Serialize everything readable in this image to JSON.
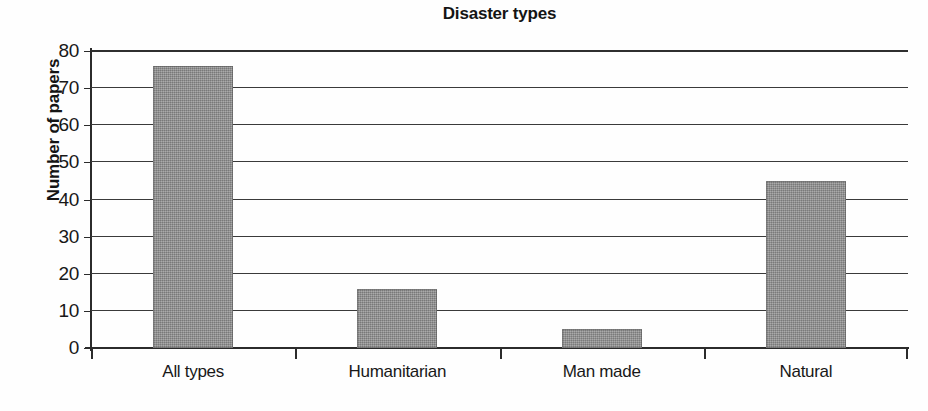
{
  "chart_data": {
    "type": "bar",
    "title": "Disaster types",
    "xlabel": "",
    "ylabel": "Number of papers",
    "categories": [
      "All types",
      "Humanitarian",
      "Man made",
      "Natural"
    ],
    "values": [
      76,
      16,
      5,
      45
    ],
    "ylim": [
      0,
      80
    ],
    "ytick_step": 10,
    "ytick_labels": [
      "80",
      "70",
      "60",
      "50",
      "40",
      "30",
      "20",
      "10",
      "0"
    ],
    "ytick_values": [
      80,
      70,
      60,
      50,
      40,
      30,
      20,
      10,
      0
    ],
    "grid": "horizontal",
    "legend": "none",
    "series": [
      {
        "name": "Number of papers",
        "values": [
          76,
          16,
          5,
          45
        ],
        "color": "#939393"
      }
    ],
    "colors": {
      "bar_fill": "#939393",
      "axis": "#2b2b2b",
      "gridline": "#3a3a3a",
      "text": "#181818",
      "background": "#ffffff"
    }
  }
}
